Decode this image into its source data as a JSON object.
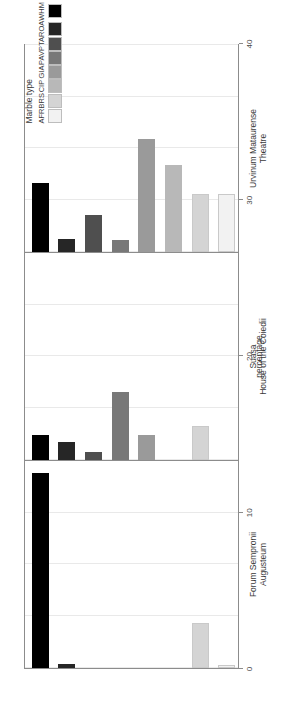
{
  "legend": {
    "title": "Marble type",
    "items": [
      {
        "label": "AFR",
        "color": "#f2f2f2"
      },
      {
        "label": "BRS",
        "color": "#d4d4d4"
      },
      {
        "label": "CIP",
        "color": "#b8b8b8"
      },
      {
        "label": "GIA",
        "color": "#9a9a9a"
      },
      {
        "label": "PAV",
        "color": "#787878"
      },
      {
        "label": "PTA",
        "color": "#4f4f4f"
      },
      {
        "label": "ROA",
        "color": "#262626"
      },
      {
        "label": "WHM",
        "color": "#000000"
      }
    ]
  },
  "axis": {
    "title": "percentage",
    "ticks": [
      "0",
      "10",
      "20",
      "30",
      "40"
    ],
    "min": 0,
    "max": 40
  },
  "panels": [
    {
      "label_line1": "Forum Sempronii",
      "label_line2": "Augusteum"
    },
    {
      "label_line1": "Suasa",
      "label_line2": "House of the Coiedii"
    },
    {
      "label_line1": "Urvinum Mataurense",
      "label_line2": "Theatre"
    }
  ],
  "chart_data": {
    "type": "bar",
    "title": "",
    "xlabel": "percentage",
    "ylabel": "",
    "xlim": [
      0,
      40
    ],
    "grid": true,
    "legend_position": "top-right",
    "orientation": "horizontal",
    "facets": [
      "Forum Sempronii Augusteum",
      "Suasa House of the Coiedii",
      "Urvinum Mataurense Theatre"
    ],
    "categories": [
      "AFR",
      "BRS",
      "CIP",
      "GIA",
      "PAV",
      "PTA",
      "ROA",
      "WHM"
    ],
    "series": [
      {
        "name": "Forum Sempronii Augusteum",
        "values": [
          0.6,
          8.6,
          0.0,
          0.0,
          0.0,
          0.0,
          0.8,
          37.7
        ]
      },
      {
        "name": "Suasa House of the Coiedii",
        "values": [
          0.0,
          6.5,
          0.0,
          4.9,
          13.2,
          1.6,
          3.4,
          4.9
        ]
      },
      {
        "name": "Urvinum Mataurense Theatre",
        "values": [
          11.3,
          11.2,
          16.8,
          21.9,
          2.3,
          7.2,
          2.5,
          13.3
        ]
      }
    ]
  }
}
